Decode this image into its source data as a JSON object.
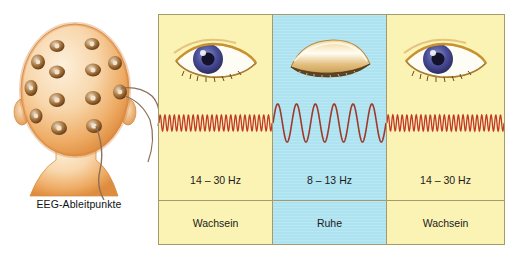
{
  "figure": {
    "left_illustration": {
      "caption": "EEG-Ableitpunkte",
      "icon": "head-with-eeg-electrodes",
      "electrode_count": 13,
      "colors": {
        "skin": "#f6d5a8",
        "skin_shade": "#e89b52",
        "electrode": "#7a4a22"
      }
    },
    "columns": [
      {
        "id": "awake-left",
        "state": "Wachsein",
        "frequency": "14 – 30 Hz",
        "eye_icon": "open-eye-icon",
        "wave_icon": "beta-wave-icon",
        "background": "#fbf3b4",
        "wave": {
          "type": "beta",
          "cycles": 24,
          "amplitude": 8,
          "color": "#c0392b"
        }
      },
      {
        "id": "rest",
        "state": "Ruhe",
        "frequency": "8 – 13 Hz",
        "eye_icon": "closed-eye-icon",
        "wave_icon": "alpha-wave-icon",
        "background": "#ade3f0",
        "wave": {
          "type": "alpha",
          "cycles": 6,
          "amplitude": 19,
          "color": "#a0392b"
        }
      },
      {
        "id": "awake-right",
        "state": "Wachsein",
        "frequency": "14 – 30 Hz",
        "eye_icon": "open-eye-icon",
        "wave_icon": "beta-wave-icon",
        "background": "#fbf3b4",
        "wave": {
          "type": "beta",
          "cycles": 25,
          "amplitude": 8,
          "color": "#c0392b"
        }
      }
    ],
    "border_color": "#a39b6e"
  }
}
